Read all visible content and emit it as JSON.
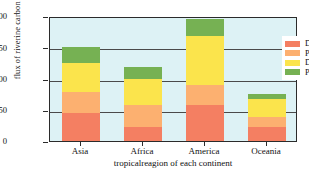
{
  "chart_data": {
    "type": "bar",
    "subtype": "stacked-vertical",
    "title": "",
    "xlabel": "tropicalreagion of each continent",
    "ylabel": "flux of riverine carbon (TgC yr⁻¹)",
    "ylabel_main": "flux of riverine carbon (TgC yr",
    "ylabel_sup": "-1",
    "ylabel_tail": ")",
    "categories": [
      "Asia",
      "Africa",
      "America",
      "Oceania"
    ],
    "ylim": [
      0,
      200
    ],
    "yticks": [
      0,
      50,
      100,
      150,
      200
    ],
    "ytick_labels": [
      "0",
      "50",
      "100",
      "150",
      "200"
    ],
    "grid": true,
    "grid_axis": "y",
    "legend_position": "top-right-inside",
    "plot_background": "#ddf2f5",
    "series": [
      {
        "name": "DOC",
        "color": "#f47f62",
        "values": [
          45,
          22,
          57,
          22
        ]
      },
      {
        "name": "POC",
        "color": "#fcb070",
        "values": [
          33,
          36,
          33,
          16
        ]
      },
      {
        "name": "DIC",
        "color": "#fbe44c",
        "values": [
          47,
          42,
          78,
          30
        ]
      },
      {
        "name": "PIC",
        "color": "#76b153",
        "values": [
          25,
          18,
          27,
          7
        ]
      }
    ],
    "totals": [
      150,
      118,
      195,
      75
    ]
  },
  "legend": {
    "items": [
      {
        "label": "DOC",
        "color": "#f47f62"
      },
      {
        "label": "POC",
        "color": "#fcb070"
      },
      {
        "label": "DIC",
        "color": "#fbe44c"
      },
      {
        "label": "PIC",
        "color": "#76b153"
      }
    ]
  },
  "colors": {
    "plot_bg": "#ddf2f5",
    "axis": "#2b2b2b",
    "grid": "#4a4a4a",
    "page_bg": "#ffffff"
  }
}
